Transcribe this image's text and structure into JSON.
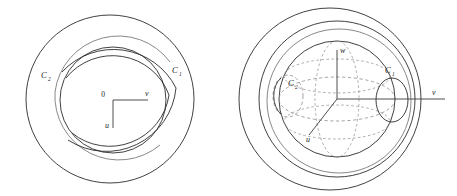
{
  "figure": {
    "background_color": "#ffffff",
    "line_color": "#2b2b2b",
    "secondary_line_color": "#6a6a6a",
    "dashed_line_color": "#8a8a8a",
    "panels": [
      {
        "id": "left",
        "name": "planar-diagram",
        "description": "Two concentric circles with spiral arcs forming a gap on the left side",
        "labels": {
          "origin": "0",
          "axis_horizontal": "v",
          "axis_vertical": "u",
          "curve_outer": "C",
          "curve_outer_sub": "1",
          "curve_inner": "C",
          "curve_inner_sub": "2"
        }
      },
      {
        "id": "right",
        "name": "sphere-diagram",
        "description": "A sphere drawn with dashed hidden latitude ellipses, surrounded by two larger circles, with small circles C1 and C2 on its equator",
        "labels": {
          "axis_vertical": "w",
          "axis_horizontal": "v",
          "axis_depth": "u",
          "curve_right": "C",
          "curve_right_sub": "1",
          "curve_left": "C",
          "curve_left_sub": "2"
        }
      }
    ]
  }
}
